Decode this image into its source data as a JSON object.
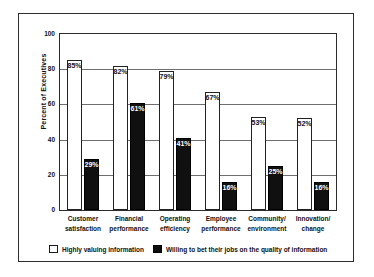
{
  "chart_data": {
    "type": "bar",
    "title": "",
    "subtitle": "",
    "xlabel": "",
    "ylabel": "Percent of Executives",
    "ylim": [
      0,
      100
    ],
    "yticks": [
      0,
      20,
      40,
      60,
      80,
      100
    ],
    "ytick_labels": [
      "0",
      "20",
      "40",
      "60",
      "80",
      "100"
    ],
    "grid": true,
    "legend_position": "bottom-left",
    "categories": [
      "Customer satisfaction",
      "Financial performance",
      "Operating efficiency",
      "Employee performance",
      "Community/ environment",
      "Innovation/ change"
    ],
    "category_lines": [
      [
        "Customer",
        "satisfaction"
      ],
      [
        "Financial",
        "performance"
      ],
      [
        "Operating",
        "efficiency"
      ],
      [
        "Employee",
        "performance"
      ],
      [
        "Community/",
        "environment"
      ],
      [
        "Innovation/",
        "change"
      ]
    ],
    "series": [
      {
        "name": "Highly valuing information",
        "color": "#ffffff",
        "edge_color": "#222222",
        "values": [
          85,
          82,
          79,
          67,
          53,
          52
        ],
        "value_labels": [
          "85%",
          "82%",
          "79%",
          "67%",
          "53%",
          "52%"
        ]
      },
      {
        "name": "Willing to bet their jobs on the quality of information",
        "color": "#101010",
        "edge_color": "#000000",
        "values": [
          29,
          61,
          41,
          16,
          25,
          16
        ],
        "value_labels": [
          "29%",
          "61%",
          "41%",
          "16%",
          "25%",
          "16%"
        ]
      }
    ]
  },
  "legend": {
    "entries": [
      {
        "label": "Highly valuing information",
        "style": "light"
      },
      {
        "label": "Willing to bet their jobs on the quality of information",
        "style": "dark"
      }
    ]
  }
}
